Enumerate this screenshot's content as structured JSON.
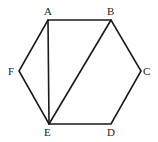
{
  "figure": {
    "type": "hexagon-diagram",
    "vertices": [
      {
        "label": "A",
        "x": 48,
        "y": 20,
        "lx": 44,
        "ly": 15
      },
      {
        "label": "B",
        "x": 111,
        "y": 20,
        "lx": 107,
        "ly": 15
      },
      {
        "label": "C",
        "x": 141,
        "y": 71,
        "lx": 143,
        "ly": 75
      },
      {
        "label": "D",
        "x": 111,
        "y": 124,
        "lx": 107,
        "ly": 136
      },
      {
        "label": "E",
        "x": 49,
        "y": 124,
        "lx": 44,
        "ly": 136
      },
      {
        "label": "F",
        "x": 19,
        "y": 71,
        "lx": 8,
        "ly": 75
      }
    ],
    "polygon": [
      "A",
      "B",
      "C",
      "D",
      "E",
      "F"
    ],
    "diagonals": [
      [
        "A",
        "E"
      ],
      [
        "B",
        "E"
      ]
    ]
  }
}
